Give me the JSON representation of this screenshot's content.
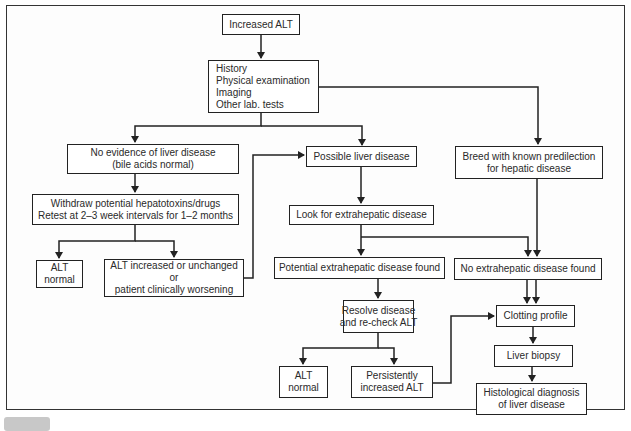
{
  "diagram": {
    "type": "flowchart",
    "nodes": {
      "start": {
        "lines": [
          "Increased ALT"
        ]
      },
      "workup": {
        "lines": [
          "History",
          "Physical examination",
          "Imaging",
          "Other lab. tests"
        ]
      },
      "no_evidence": {
        "lines": [
          "No evidence of liver disease",
          "(bile acids normal)"
        ]
      },
      "withdraw": {
        "lines": [
          "Withdraw potential hepatotoxins/drugs",
          "Retest at 2–3 week intervals for 1–2 months"
        ]
      },
      "alt_normal_left": {
        "lines": [
          "ALT",
          "normal"
        ]
      },
      "alt_increased": {
        "lines": [
          "ALT increased or unchanged",
          "or",
          "patient clinically worsening"
        ]
      },
      "possible_liver": {
        "lines": [
          "Possible liver disease"
        ]
      },
      "breed": {
        "lines": [
          "Breed with known predilection",
          "for hepatic disease"
        ]
      },
      "look_extrahepatic": {
        "lines": [
          "Look for extrahepatic disease"
        ]
      },
      "potential_found": {
        "lines": [
          "Potential extrahepatic disease found"
        ]
      },
      "no_extrahepatic": {
        "lines": [
          "No extrahepatic disease found"
        ]
      },
      "resolve": {
        "lines": [
          "Resolve disease",
          "and re-check ALT"
        ]
      },
      "alt_normal_mid": {
        "lines": [
          "ALT",
          "normal"
        ]
      },
      "persistent": {
        "lines": [
          "Persistently",
          "increased ALT"
        ]
      },
      "clotting": {
        "lines": [
          "Clotting profile"
        ]
      },
      "biopsy": {
        "lines": [
          "Liver biopsy"
        ]
      },
      "histology": {
        "lines": [
          "Histological diagnosis",
          "of liver disease"
        ]
      }
    },
    "edges": [
      [
        "start",
        "workup"
      ],
      [
        "workup",
        "no_evidence"
      ],
      [
        "workup",
        "possible_liver"
      ],
      [
        "workup",
        "breed"
      ],
      [
        "no_evidence",
        "withdraw"
      ],
      [
        "withdraw",
        "alt_normal_left"
      ],
      [
        "withdraw",
        "alt_increased"
      ],
      [
        "alt_increased",
        "possible_liver"
      ],
      [
        "possible_liver",
        "look_extrahepatic"
      ],
      [
        "look_extrahepatic",
        "potential_found"
      ],
      [
        "look_extrahepatic",
        "no_extrahepatic"
      ],
      [
        "breed",
        "no_extrahepatic"
      ],
      [
        "potential_found",
        "resolve"
      ],
      [
        "no_extrahepatic",
        "clotting"
      ],
      [
        "resolve",
        "alt_normal_mid"
      ],
      [
        "resolve",
        "persistent"
      ],
      [
        "persistent",
        "clotting"
      ],
      [
        "clotting",
        "biopsy"
      ],
      [
        "biopsy",
        "histology"
      ]
    ]
  },
  "colors": {
    "line": "#222222",
    "frame": "#333333",
    "caption_badge": "#c8c8c8"
  }
}
